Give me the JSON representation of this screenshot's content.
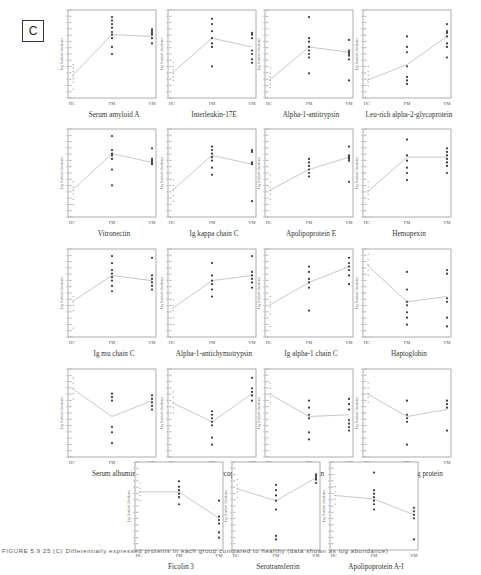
{
  "figure": {
    "panel_label": "C",
    "caption": "FIGURE 5.9 25 (C) Differentially expressed proteins in each group compared to healthy (data shown as log abundance)"
  },
  "axis": {
    "ylabel": "Log Standard Abundance",
    "xticks": [
      "HC",
      "FM",
      "VM"
    ]
  },
  "colors": {
    "axis": "#9a9a9a",
    "line": "#c8c8c8",
    "dot": "#3a3a3a",
    "text": "#333333"
  },
  "chart_data": [
    {
      "type": "scatter",
      "title": "Serum amyloid A",
      "categories": [
        "HC",
        "FM",
        "VM"
      ],
      "means": [
        0.25,
        0.72,
        0.7
      ],
      "points": {
        "HC": [
          0.1,
          0.18,
          0.22,
          0.25,
          0.3,
          0.34,
          0.38
        ],
        "FM": [
          0.5,
          0.58,
          0.68,
          0.72,
          0.75,
          0.8,
          0.84,
          0.88,
          0.92
        ],
        "VM": [
          0.62,
          0.68,
          0.72,
          0.74,
          0.76,
          0.78
        ]
      }
    },
    {
      "type": "scatter",
      "title": "Interleukin-17E",
      "categories": [
        "HC",
        "FM",
        "VM"
      ],
      "means": [
        0.28,
        0.68,
        0.58
      ],
      "points": {
        "HC": [
          0.2,
          0.24,
          0.28,
          0.32,
          0.36,
          0.4
        ],
        "FM": [
          0.36,
          0.58,
          0.62,
          0.68,
          0.76,
          0.84,
          0.9
        ],
        "VM": [
          0.4,
          0.44,
          0.5,
          0.54,
          0.68,
          0.72,
          0.74
        ]
      }
    },
    {
      "type": "scatter",
      "title": "Alpha-1-antitrypsin",
      "categories": [
        "HC",
        "FM",
        "VM"
      ],
      "means": [
        0.2,
        0.58,
        0.52
      ],
      "points": {
        "HC": [
          0.12,
          0.16,
          0.2,
          0.24,
          0.28,
          0.34
        ],
        "FM": [
          0.28,
          0.46,
          0.5,
          0.54,
          0.58,
          0.64,
          0.68,
          0.92
        ],
        "VM": [
          0.2,
          0.44,
          0.48,
          0.5,
          0.52,
          0.54,
          0.66
        ]
      }
    },
    {
      "type": "scatter",
      "title": "Leu-rich alpha-2-glycoprotein",
      "categories": [
        "HC",
        "FM",
        "VM"
      ],
      "means": [
        0.2,
        0.38,
        0.7
      ],
      "points": {
        "HC": [
          0.14,
          0.18,
          0.22,
          0.26,
          0.3,
          0.36
        ],
        "FM": [
          0.16,
          0.2,
          0.24,
          0.36,
          0.52,
          0.58,
          0.7
        ],
        "VM": [
          0.46,
          0.58,
          0.62,
          0.7,
          0.74,
          0.76,
          0.84
        ]
      }
    },
    {
      "type": "scatter",
      "title": "Vitronectin",
      "categories": [
        "HC",
        "FM",
        "VM"
      ],
      "means": [
        0.3,
        0.72,
        0.62
      ],
      "points": {
        "HC": [
          0.14,
          0.2,
          0.26,
          0.3,
          0.34,
          0.4
        ],
        "FM": [
          0.36,
          0.54,
          0.66,
          0.7,
          0.72,
          0.76,
          0.92
        ],
        "VM": [
          0.6,
          0.62,
          0.64,
          0.66,
          0.78
        ]
      }
    },
    {
      "type": "scatter",
      "title": "Ig kappa chain C",
      "categories": [
        "HC",
        "FM",
        "VM"
      ],
      "means": [
        0.3,
        0.7,
        0.6
      ],
      "points": {
        "HC": [
          0.18,
          0.24,
          0.3,
          0.36,
          0.42
        ],
        "FM": [
          0.48,
          0.56,
          0.64,
          0.68,
          0.72,
          0.76,
          0.8
        ],
        "VM": [
          0.18,
          0.6,
          0.62,
          0.74,
          0.76
        ]
      }
    },
    {
      "type": "scatter",
      "title": "Apolipoprotein E",
      "categories": [
        "HC",
        "FM",
        "VM"
      ],
      "means": [
        0.3,
        0.54,
        0.68
      ],
      "points": {
        "HC": [
          0.2,
          0.26,
          0.3,
          0.34,
          0.4,
          0.48
        ],
        "FM": [
          0.46,
          0.5,
          0.54,
          0.58,
          0.62,
          0.66
        ],
        "VM": [
          0.4,
          0.64,
          0.66,
          0.68,
          0.7,
          0.8
        ]
      }
    },
    {
      "type": "scatter",
      "title": "Hemopexin",
      "categories": [
        "HC",
        "FM",
        "VM"
      ],
      "means": [
        0.28,
        0.68,
        0.68
      ],
      "points": {
        "HC": [
          0.2,
          0.26,
          0.3,
          0.34,
          0.4
        ],
        "FM": [
          0.42,
          0.5,
          0.56,
          0.64,
          0.7,
          0.88
        ],
        "VM": [
          0.5,
          0.58,
          0.62,
          0.66,
          0.7,
          0.74,
          0.78
        ]
      }
    },
    {
      "type": "scatter",
      "title": "Ig mu chain C",
      "categories": [
        "HC",
        "FM",
        "VM"
      ],
      "means": [
        0.4,
        0.7,
        0.64
      ],
      "points": {
        "HC": [
          0.1,
          0.3,
          0.36,
          0.4,
          0.46
        ],
        "FM": [
          0.52,
          0.58,
          0.64,
          0.68,
          0.72,
          0.76,
          0.84,
          0.92
        ],
        "VM": [
          0.54,
          0.58,
          0.62,
          0.66,
          0.7,
          0.9
        ]
      }
    },
    {
      "type": "scatter",
      "title": "Alpha-1-antichymotrypsin",
      "categories": [
        "HC",
        "FM",
        "VM"
      ],
      "means": [
        0.32,
        0.64,
        0.7
      ],
      "points": {
        "HC": [
          0.14,
          0.22,
          0.3,
          0.36,
          0.42
        ],
        "FM": [
          0.46,
          0.54,
          0.6,
          0.64,
          0.7,
          0.84
        ],
        "VM": [
          0.56,
          0.62,
          0.66,
          0.7,
          0.74,
          0.92
        ]
      }
    },
    {
      "type": "scatter",
      "title": "Ig alpha-1 chain C",
      "categories": [
        "HC",
        "FM",
        "VM"
      ],
      "means": [
        0.36,
        0.62,
        0.8
      ],
      "points": {
        "HC": [
          0.12,
          0.26,
          0.34,
          0.4,
          0.46
        ],
        "FM": [
          0.3,
          0.56,
          0.62,
          0.66,
          0.74,
          0.8
        ],
        "VM": [
          0.6,
          0.7,
          0.76,
          0.8,
          0.84,
          0.9
        ]
      }
    },
    {
      "type": "scatter",
      "title": "Haptoglobin",
      "categories": [
        "HC",
        "FM",
        "VM"
      ],
      "means": [
        0.82,
        0.4,
        0.46
      ],
      "points": {
        "HC": [
          0.7,
          0.76,
          0.82,
          0.88,
          0.94
        ],
        "FM": [
          0.14,
          0.22,
          0.28,
          0.36,
          0.4,
          0.54,
          0.74
        ],
        "VM": [
          0.12,
          0.22,
          0.4,
          0.44,
          0.72,
          0.76
        ]
      }
    },
    {
      "type": "scatter",
      "title": "Serum albumin",
      "categories": [
        "HC",
        "FM",
        "VM"
      ],
      "means": [
        0.78,
        0.46,
        0.64
      ],
      "points": {
        "HC": [
          0.66,
          0.72,
          0.78,
          0.84,
          0.9
        ],
        "FM": [
          0.16,
          0.28,
          0.34,
          0.64,
          0.68,
          0.72
        ],
        "VM": [
          0.54,
          0.58,
          0.62,
          0.66,
          0.7
        ]
      }
    },
    {
      "type": "scatter",
      "title": "Alpha-2-HS-glycoprotein",
      "categories": [
        "HC",
        "FM",
        "VM"
      ],
      "means": [
        0.62,
        0.4,
        0.72
      ],
      "points": {
        "HC": [
          0.5,
          0.56,
          0.62,
          0.68,
          0.74
        ],
        "FM": [
          0.14,
          0.22,
          0.36,
          0.4,
          0.44,
          0.48,
          0.52
        ],
        "VM": [
          0.64,
          0.7,
          0.74,
          0.78,
          0.9
        ]
      }
    },
    {
      "type": "scatter",
      "title": "Clusterin",
      "categories": [
        "HC",
        "FM",
        "VM"
      ],
      "means": [
        0.72,
        0.46,
        0.48
      ],
      "points": {
        "HC": [
          0.62,
          0.68,
          0.72,
          0.78,
          0.84
        ],
        "FM": [
          0.2,
          0.28,
          0.44,
          0.48,
          0.56,
          0.64
        ],
        "VM": [
          0.3,
          0.34,
          0.38,
          0.42,
          0.54,
          0.6,
          0.66
        ]
      }
    },
    {
      "type": "scatter",
      "title": "Retinol-binding protein",
      "categories": [
        "HC",
        "FM",
        "VM"
      ],
      "means": [
        0.72,
        0.46,
        0.54
      ],
      "points": {
        "HC": [
          0.62,
          0.68,
          0.72,
          0.78,
          0.84
        ],
        "FM": [
          0.14,
          0.4,
          0.44,
          0.48,
          0.64
        ],
        "VM": [
          0.3,
          0.56,
          0.6,
          0.64
        ]
      }
    },
    {
      "type": "scatter",
      "title": "Ficolin 3",
      "categories": [
        "HC",
        "FM",
        "VM"
      ],
      "means": [
        0.66,
        0.66,
        0.36
      ],
      "points": {
        "HC": [
          0.56,
          0.62,
          0.66,
          0.7,
          0.76
        ],
        "FM": [
          0.52,
          0.6,
          0.64,
          0.68,
          0.72,
          0.78
        ],
        "VM": [
          0.14,
          0.2,
          0.3,
          0.34,
          0.38,
          0.56
        ]
      }
    },
    {
      "type": "scatter",
      "title": "Serotransferrin",
      "categories": [
        "HC",
        "FM",
        "VM"
      ],
      "means": [
        0.7,
        0.56,
        0.82
      ],
      "points": {
        "HC": [
          0.6,
          0.66,
          0.7,
          0.74,
          0.8
        ],
        "FM": [
          0.12,
          0.16,
          0.46,
          0.56,
          0.62,
          0.68,
          0.74
        ],
        "VM": [
          0.76,
          0.8,
          0.82,
          0.84,
          0.86
        ]
      }
    },
    {
      "type": "scatter",
      "title": "Apolipoprotein A-I",
      "categories": [
        "HC",
        "FM",
        "VM"
      ],
      "means": [
        0.62,
        0.58,
        0.4
      ],
      "points": {
        "HC": [
          0.52,
          0.58,
          0.62,
          0.66,
          0.72
        ],
        "FM": [
          0.46,
          0.52,
          0.56,
          0.6,
          0.64,
          0.68,
          0.88
        ],
        "VM": [
          0.12,
          0.36,
          0.4,
          0.44,
          0.48
        ]
      }
    }
  ],
  "layout_rows": [
    [
      0,
      1,
      2,
      3
    ],
    [
      4,
      5,
      6,
      7
    ],
    [
      8,
      9,
      10,
      11
    ],
    [
      12,
      13,
      14,
      15
    ],
    [
      16,
      17,
      18
    ]
  ]
}
